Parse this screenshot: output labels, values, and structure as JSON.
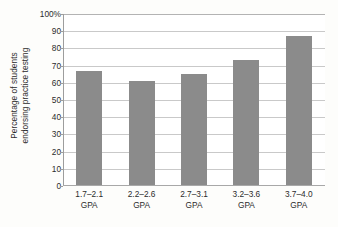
{
  "chart_data": {
    "type": "bar",
    "title": "",
    "xlabel": "",
    "ylabel_line1": "Percentage of students",
    "ylabel_line2": "endorsing practice testing",
    "categories": [
      "1.7–2.1",
      "2.2–2.6",
      "2.7–3.1",
      "3.2–3.6",
      "3.7–4.0"
    ],
    "category_unit": "GPA",
    "values": [
      67,
      61,
      65,
      73,
      87
    ],
    "ylim": [
      0,
      100
    ],
    "ytick_values": [
      0,
      10,
      20,
      30,
      40,
      50,
      60,
      70,
      80,
      90,
      100
    ],
    "ytick_labels": [
      "0",
      "10",
      "20",
      "30",
      "40",
      "50",
      "60",
      "70",
      "80",
      "90",
      "100%"
    ],
    "grid": true,
    "legend": "none",
    "bar_color": "#8b8b8b",
    "gridline_color": "#c9c9c9",
    "plot_background": "#ffffff",
    "figure_background": "#fdfdfb"
  }
}
